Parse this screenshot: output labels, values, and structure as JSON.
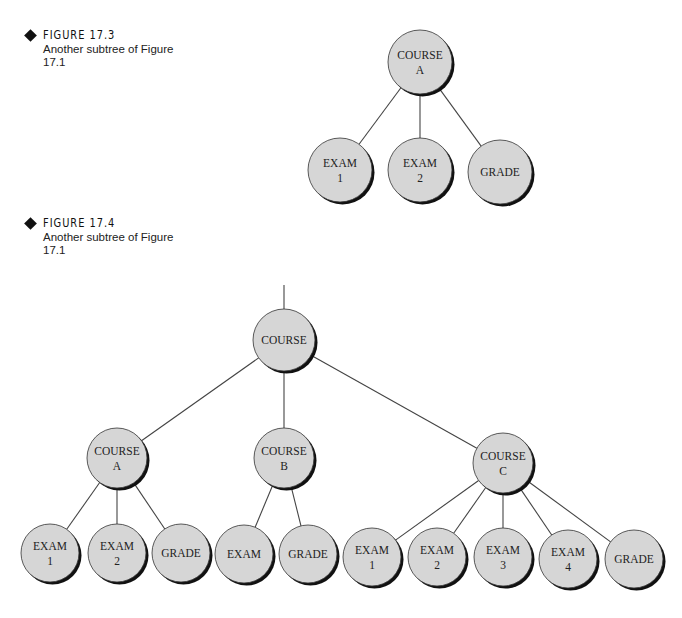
{
  "figures": [
    {
      "label": "FIGURE 17.3",
      "description": "Another subtree of Figure 17.1",
      "tree": {
        "nodes": [
          {
            "id": "courseA",
            "lines": [
              "COURSE",
              "A"
            ],
            "cx": 420,
            "cy": 62,
            "r": 32
          },
          {
            "id": "exam1",
            "lines": [
              "EXAM",
              "1"
            ],
            "cx": 340,
            "cy": 170,
            "r": 32
          },
          {
            "id": "exam2",
            "lines": [
              "EXAM",
              "2"
            ],
            "cx": 420,
            "cy": 170,
            "r": 32
          },
          {
            "id": "grade",
            "lines": [
              "GRADE"
            ],
            "cx": 500,
            "cy": 172,
            "r": 32
          }
        ],
        "edges": [
          [
            "courseA",
            "exam1"
          ],
          [
            "courseA",
            "exam2"
          ],
          [
            "courseA",
            "grade"
          ]
        ]
      }
    },
    {
      "label": "FIGURE 17.4",
      "description": "Another subtree of Figure 17.1",
      "tree": {
        "root_stub": {
          "x": 284,
          "y1": 285,
          "y2": 309
        },
        "nodes": [
          {
            "id": "course",
            "lines": [
              "COURSE"
            ],
            "cx": 284,
            "cy": 340,
            "r": 31
          },
          {
            "id": "courseA",
            "lines": [
              "COURSE",
              "A"
            ],
            "cx": 117,
            "cy": 458,
            "r": 30
          },
          {
            "id": "courseB",
            "lines": [
              "COURSE",
              "B"
            ],
            "cx": 284,
            "cy": 458,
            "r": 30
          },
          {
            "id": "courseC",
            "lines": [
              "COURSE",
              "C"
            ],
            "cx": 503,
            "cy": 463,
            "r": 30
          },
          {
            "id": "a_exam1",
            "lines": [
              "EXAM",
              "1"
            ],
            "cx": 50,
            "cy": 553,
            "r": 29
          },
          {
            "id": "a_exam2",
            "lines": [
              "EXAM",
              "2"
            ],
            "cx": 117,
            "cy": 553,
            "r": 29
          },
          {
            "id": "a_grade",
            "lines": [
              "GRADE"
            ],
            "cx": 181,
            "cy": 553,
            "r": 29
          },
          {
            "id": "b_exam",
            "lines": [
              "EXAM"
            ],
            "cx": 244,
            "cy": 554,
            "r": 29
          },
          {
            "id": "b_grade",
            "lines": [
              "GRADE"
            ],
            "cx": 308,
            "cy": 554,
            "r": 29
          },
          {
            "id": "c_exam1",
            "lines": [
              "EXAM",
              "1"
            ],
            "cx": 372,
            "cy": 557,
            "r": 29
          },
          {
            "id": "c_exam2",
            "lines": [
              "EXAM",
              "2"
            ],
            "cx": 437,
            "cy": 557,
            "r": 29
          },
          {
            "id": "c_exam3",
            "lines": [
              "EXAM",
              "3"
            ],
            "cx": 503,
            "cy": 557,
            "r": 29
          },
          {
            "id": "c_exam4",
            "lines": [
              "EXAM",
              "4"
            ],
            "cx": 568,
            "cy": 559,
            "r": 29
          },
          {
            "id": "c_grade",
            "lines": [
              "GRADE"
            ],
            "cx": 634,
            "cy": 559,
            "r": 29
          }
        ],
        "edges": [
          [
            "course",
            "courseA"
          ],
          [
            "course",
            "courseB"
          ],
          [
            "course",
            "courseC"
          ],
          [
            "courseA",
            "a_exam1"
          ],
          [
            "courseA",
            "a_exam2"
          ],
          [
            "courseA",
            "a_grade"
          ],
          [
            "courseB",
            "b_exam"
          ],
          [
            "courseB",
            "b_grade"
          ],
          [
            "courseC",
            "c_exam1"
          ],
          [
            "courseC",
            "c_exam2"
          ],
          [
            "courseC",
            "c_exam3"
          ],
          [
            "courseC",
            "c_exam4"
          ],
          [
            "courseC",
            "c_grade"
          ]
        ]
      }
    }
  ],
  "colors": {
    "node_fill": "#d6d6d6",
    "node_shadow": "#111111",
    "node_stroke": "#333333",
    "edge": "#444444"
  }
}
